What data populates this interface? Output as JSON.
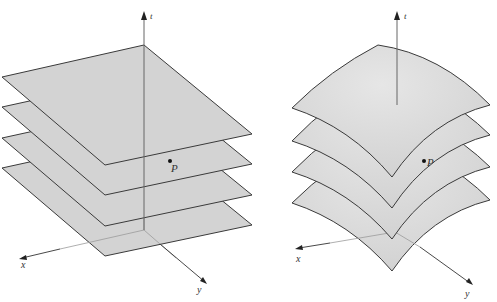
{
  "figures": [
    {
      "id": "left",
      "description": "Stack of flat parallel planes (level surfaces) in x,y,t space",
      "axes": {
        "t_label": "t",
        "x_label": "x",
        "y_label": "y"
      },
      "point_label": "P",
      "surface_count": 4,
      "surface_type": "flat"
    },
    {
      "id": "right",
      "description": "Stack of curved parallel surfaces (level surfaces) in x,y,t space",
      "axes": {
        "t_label": "t",
        "x_label": "x",
        "y_label": "y"
      },
      "point_label": "P",
      "surface_count": 4,
      "surface_type": "curved"
    }
  ],
  "colors": {
    "surface_fill": "#d4d4d4",
    "surface_edge": "#3a3a3a",
    "axis": "#555555",
    "background": "#ffffff"
  }
}
